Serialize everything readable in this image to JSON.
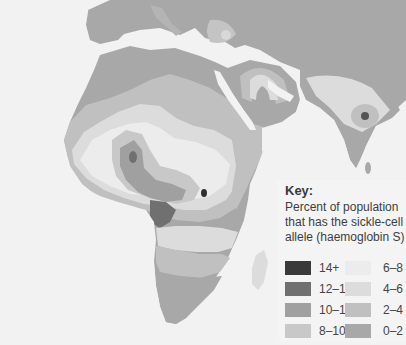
{
  "map": {
    "region": "Africa, Middle East and South Asia",
    "sea_color": "#f2f2f2",
    "land_outside_color": "#a6a6a6"
  },
  "key": {
    "title": "Key:",
    "description": "Percent of population that has the sickle-cell allele (haemoglobin S)",
    "items": [
      {
        "label": "14+",
        "color": "#3a3a3a"
      },
      {
        "label": "12–14",
        "color": "#707070"
      },
      {
        "label": "10–12",
        "color": "#a0a0a0"
      },
      {
        "label": "8–10",
        "color": "#c8c8c8"
      },
      {
        "label": "6–8",
        "color": "#ececec"
      },
      {
        "label": "4–6",
        "color": "#dcdcdc"
      },
      {
        "label": "2–4",
        "color": "#c0c0c0"
      },
      {
        "label": "0–2",
        "color": "#a8a8a8"
      }
    ]
  }
}
